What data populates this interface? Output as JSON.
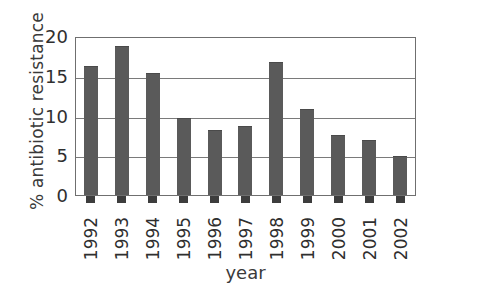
{
  "chart_data": {
    "type": "bar",
    "title": "",
    "xlabel": "year",
    "ylabel": "% antibiotic resistance",
    "categories": [
      "1992",
      "1993",
      "1994",
      "1995",
      "1996",
      "1997",
      "1998",
      "1999",
      "2000",
      "2001",
      "2002"
    ],
    "values": [
      16.4,
      19,
      15.6,
      9.8,
      8.3,
      8.8,
      17,
      11,
      7.7,
      7,
      5
    ],
    "series": [
      {
        "name": "% antibiotic resistance",
        "values": [
          16.4,
          19,
          15.6,
          9.8,
          8.3,
          8.8,
          17,
          11,
          7.7,
          7,
          5
        ]
      }
    ],
    "ylim": [
      0,
      20
    ],
    "yticks": [
      0,
      5,
      10,
      15,
      20
    ],
    "ytick_labels": [
      "0",
      "5",
      "10",
      "15",
      "20"
    ],
    "grid": true,
    "grid_axis": "y",
    "legend": false,
    "legend_position": "none",
    "bar_color": "#5a5a5a",
    "axis_color": "#6f6f6f",
    "background_color": "#ffffff"
  }
}
